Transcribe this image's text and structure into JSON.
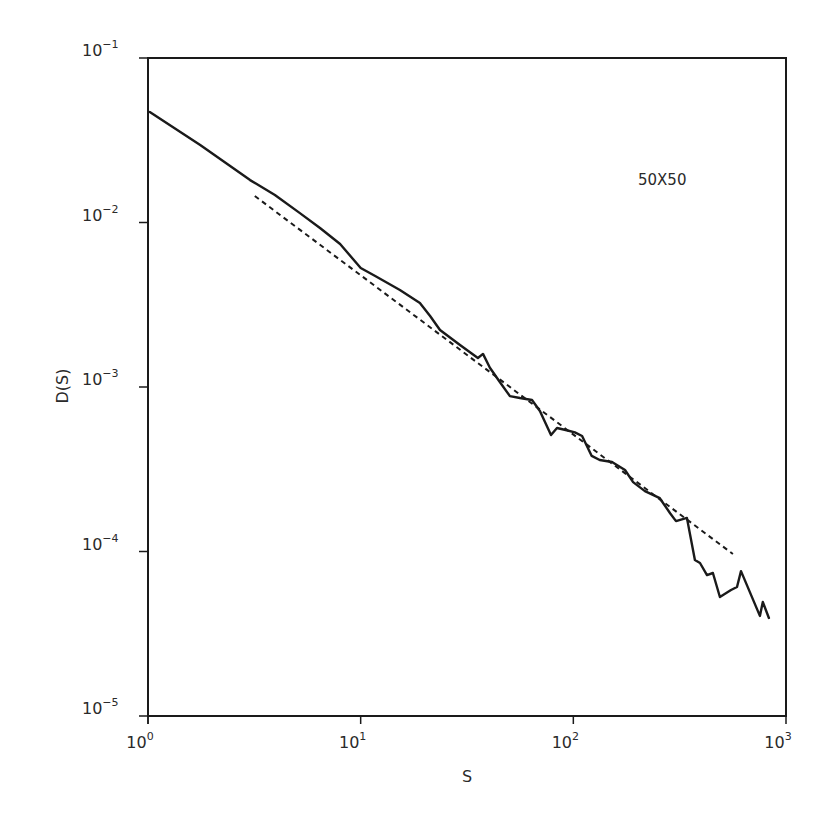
{
  "chart_data": {
    "type": "line",
    "title": "",
    "xlabel": "S",
    "ylabel": "D(S)",
    "xscale": "log",
    "yscale": "log",
    "xlim": [
      1,
      1000
    ],
    "ylim": [
      1e-05,
      0.1
    ],
    "grid": false,
    "legend": null,
    "x_ticks": [
      {
        "value": 1,
        "base": "10",
        "exp": "0"
      },
      {
        "value": 10,
        "base": "10",
        "exp": "1"
      },
      {
        "value": 100,
        "base": "10",
        "exp": "2"
      },
      {
        "value": 1000,
        "base": "10",
        "exp": "3"
      }
    ],
    "y_ticks": [
      {
        "value": 0.1,
        "base": "10",
        "exp": "−1"
      },
      {
        "value": 0.01,
        "base": "10",
        "exp": "−2"
      },
      {
        "value": 0.001,
        "base": "10",
        "exp": "−3"
      },
      {
        "value": 0.0001,
        "base": "10",
        "exp": "−4"
      },
      {
        "value": 1e-05,
        "base": "10",
        "exp": "−5"
      }
    ],
    "annotations": [
      {
        "text": "50X50",
        "x": 190,
        "y": 0.021
      }
    ],
    "series": [
      {
        "name": "D(S) simulation",
        "style": "solid",
        "color": "#1a1a1a",
        "x": [
          1.02,
          1.76,
          3.02,
          3.95,
          5.18,
          6.44,
          8.0,
          10.0,
          11.7,
          15.3,
          19.0,
          21.2,
          23.6,
          29.3,
          35.6,
          37.6,
          40.5,
          45.2,
          50.3,
          56.1,
          63.9,
          69.6,
          78.5,
          83.8,
          92,
          101.7,
          110,
          122,
          133,
          152,
          175,
          191,
          217,
          255,
          285,
          304,
          342,
          373,
          394,
          425,
          453,
          489,
          551,
          588,
          614,
          754,
          778,
          831
        ],
        "y": [
          0.047,
          0.0296,
          0.0181,
          0.0147,
          0.0114,
          0.00926,
          0.0074,
          0.00529,
          0.00473,
          0.00389,
          0.00324,
          0.0027,
          0.00222,
          0.0018,
          0.0015,
          0.00159,
          0.00131,
          0.00107,
          0.00088,
          0.000857,
          0.000834,
          0.000715,
          0.00051,
          0.000563,
          0.000548,
          0.00053,
          0.000504,
          0.000381,
          0.00036,
          0.00035,
          0.000313,
          0.000264,
          0.000233,
          0.000211,
          0.000171,
          0.000153,
          0.00016,
          8.88e-05,
          8.51e-05,
          7.19e-05,
          7.4e-05,
          5.29e-05,
          5.83e-05,
          6.08e-05,
          7.6e-05,
          4.06e-05,
          4.93e-05,
          3.94e-05
        ]
      },
      {
        "name": "power-law fit",
        "style": "dashed",
        "color": "#1a1a1a",
        "x": [
          3.18,
          563
        ],
        "y": [
          0.0145,
          9.66e-05
        ]
      }
    ]
  }
}
